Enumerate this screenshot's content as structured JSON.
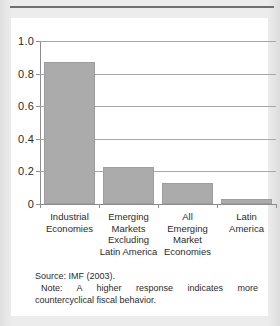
{
  "figure": {
    "source_text": "Source: IMF (2003).",
    "note_text": "Note: A higher response indicates more countercyclical fiscal behavior."
  },
  "colors": {
    "bar_fill": "#ababab",
    "bar_stroke": "#9d9d9d",
    "gridline": "#a7a7a7",
    "axis": "#8d8d8d",
    "card_background": "#ffffff",
    "page_background": "#ececec",
    "text": "#2b2b2b",
    "top_rule": "#6f6f6f"
  },
  "chart_data": {
    "type": "bar",
    "title": "",
    "xlabel": "",
    "ylabel": "",
    "categories": [
      "Industrial\nEconomies",
      "Emerging\nMarkets\nExcluding\nLatin America",
      "All\nEmerging\nMarket\nEconomies",
      "Latin\nAmerica"
    ],
    "values": [
      0.87,
      0.23,
      0.13,
      0.03
    ],
    "ylim": [
      0,
      1.0
    ],
    "yticks": [
      0,
      0.2,
      0.4,
      0.6,
      0.8,
      1.0
    ],
    "ytick_labels": [
      "0",
      "0.2",
      "0.4",
      "0.6",
      "0.8",
      "1.0"
    ],
    "grid": true,
    "legend": "none"
  }
}
